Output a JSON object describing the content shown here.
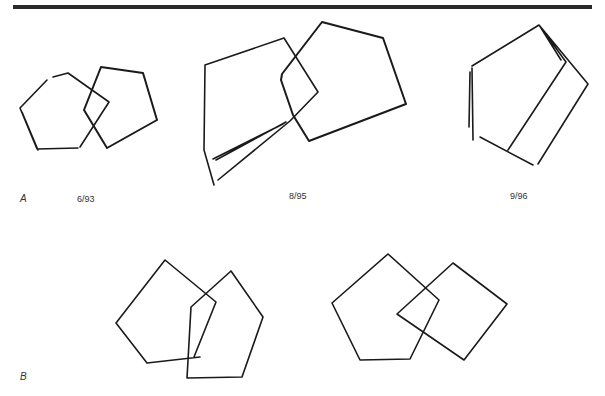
{
  "figure": {
    "panels": [
      {
        "id": "A",
        "label": "A",
        "drawings": [
          {
            "date": "6/93",
            "description": "two overlapping pentagons copy"
          },
          {
            "date": "8/95",
            "description": "overlapping pentagons copy, distorted"
          },
          {
            "date": "9/96",
            "description": "single distorted polygon copy"
          }
        ]
      },
      {
        "id": "B",
        "label": "B",
        "drawings": [
          {
            "description": "overlapping pentagons copy"
          },
          {
            "description": "pentagon overlapping diamond copy"
          }
        ]
      }
    ],
    "colors": {
      "ink": "#1a1a1a",
      "rule": "#2a2a2a",
      "background": "#ffffff"
    }
  }
}
